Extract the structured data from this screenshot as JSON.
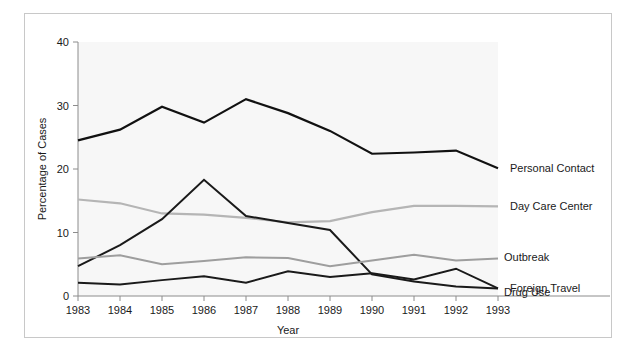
{
  "chart_data": {
    "type": "line",
    "title": "",
    "xlabel": "Year",
    "ylabel": "Percentage of Cases",
    "categories": [
      "1983",
      "1984",
      "1985",
      "1986",
      "1987",
      "1988",
      "1989",
      "1990",
      "1991",
      "1992",
      "1993"
    ],
    "x": [
      1983,
      1984,
      1985,
      1986,
      1987,
      1988,
      1989,
      1990,
      1991,
      1992,
      1993
    ],
    "xlim": [
      1983,
      1993
    ],
    "ylim": [
      0,
      40
    ],
    "yticks": [
      0,
      10,
      20,
      30,
      40
    ],
    "ytick_labels": [
      "0",
      "10",
      "20",
      "30",
      "40"
    ],
    "grid": false,
    "legend_position": "right-inline-labels",
    "series": [
      {
        "name": "Personal Contact",
        "color": "#111111",
        "width": 2.2,
        "values": [
          24.5,
          26.2,
          29.8,
          27.3,
          31.0,
          28.8,
          26.0,
          22.4,
          22.6,
          22.9,
          20.1
        ]
      },
      {
        "name": "Day Care Center",
        "color": "#b5b5b5",
        "width": 2.2,
        "values": [
          15.2,
          14.6,
          13.0,
          12.8,
          12.3,
          11.6,
          11.8,
          13.2,
          14.2,
          14.2,
          14.1
        ]
      },
      {
        "name": "Foreign Travel",
        "color": "#1a1a1a",
        "width": 2.0,
        "values": [
          4.7,
          8.0,
          12.1,
          18.3,
          12.6,
          11.5,
          10.4,
          3.4,
          2.3,
          1.5,
          1.2
        ]
      },
      {
        "name": "Outbreak",
        "color": "#9e9e9e",
        "width": 2.0,
        "values": [
          5.9,
          6.4,
          5.0,
          5.5,
          6.1,
          6.0,
          4.7,
          5.6,
          6.5,
          5.6,
          5.9
        ]
      },
      {
        "name": "Drug Use",
        "color": "#1a1a1a",
        "width": 2.0,
        "values": [
          2.1,
          1.8,
          2.5,
          3.1,
          2.1,
          3.9,
          3.0,
          3.6,
          2.6,
          4.3,
          1.2
        ]
      }
    ],
    "series_label_offsets": [
      0,
      0,
      0,
      -2,
      4
    ]
  },
  "axes": {
    "y_axis_title": "Percentage of Cases",
    "x_axis_title": "Year"
  }
}
